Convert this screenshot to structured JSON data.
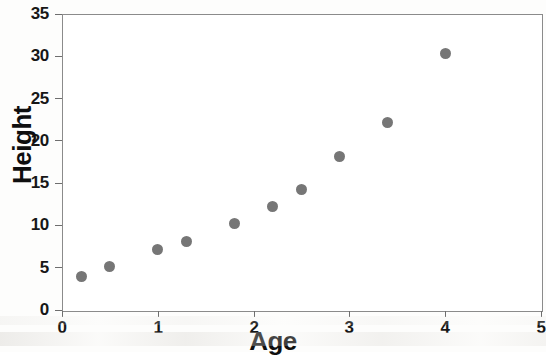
{
  "figure": {
    "partial_top_title": "Height vs Age",
    "marker_color": "#767676",
    "axis_color": "#8b8b8b",
    "text_color": "#111111",
    "plot_background": "#ffffff"
  },
  "chart_data": {
    "type": "scatter",
    "title": "",
    "xlabel": "Age",
    "ylabel": "Height",
    "xlim": [
      0,
      5
    ],
    "ylim": [
      0,
      35
    ],
    "xticks": [
      0,
      1,
      2,
      3,
      4,
      5
    ],
    "yticks": [
      0,
      5,
      10,
      15,
      20,
      25,
      30,
      35
    ],
    "xticklabels": [
      "0",
      "1",
      "2",
      "3",
      "4",
      "5"
    ],
    "yticklabels": [
      "0",
      "5",
      "10",
      "15",
      "20",
      "25",
      "30",
      "35"
    ],
    "grid": false,
    "legend": false,
    "series": [
      {
        "name": "Height vs Age",
        "marker": "circle",
        "color": "#767676",
        "points": [
          {
            "x": 0.2,
            "y": 4.0
          },
          {
            "x": 0.5,
            "y": 5.1
          },
          {
            "x": 1.0,
            "y": 7.1
          },
          {
            "x": 1.3,
            "y": 8.1
          },
          {
            "x": 1.8,
            "y": 10.2
          },
          {
            "x": 2.2,
            "y": 12.2
          },
          {
            "x": 2.5,
            "y": 14.3
          },
          {
            "x": 2.9,
            "y": 18.2
          },
          {
            "x": 3.4,
            "y": 22.2
          },
          {
            "x": 4.0,
            "y": 30.3
          }
        ]
      }
    ]
  }
}
